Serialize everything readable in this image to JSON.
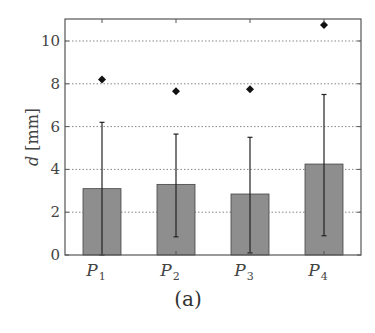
{
  "chart_data": {
    "type": "bar",
    "title": "",
    "caption": "(a)",
    "xlabel": "",
    "ylabel": "d [mm]",
    "ylabel_var": "d",
    "ylabel_unit": "[mm]",
    "ylim": [
      0,
      11
    ],
    "yticks": [
      0,
      2,
      4,
      6,
      8,
      10
    ],
    "grid": "horizontal dotted",
    "categories": [
      "P1",
      "P2",
      "P3",
      "P4"
    ],
    "category_labels": [
      {
        "base": "P",
        "sub": "1"
      },
      {
        "base": "P",
        "sub": "2"
      },
      {
        "base": "P",
        "sub": "3"
      },
      {
        "base": "P",
        "sub": "4"
      }
    ],
    "series": [
      {
        "name": "mean",
        "values": [
          3.1,
          3.3,
          2.85,
          4.25
        ]
      },
      {
        "name": "error_lower",
        "values": [
          0.0,
          0.85,
          0.1,
          0.9
        ]
      },
      {
        "name": "error_upper",
        "values": [
          6.2,
          5.65,
          5.5,
          7.5
        ]
      },
      {
        "name": "max (diamond markers)",
        "values": [
          8.2,
          7.65,
          7.75,
          10.75
        ]
      }
    ],
    "colors": {
      "bar_fill": "#8e8e8e",
      "bar_edge": "#444444",
      "grid": "#888888",
      "axis": "#555555",
      "marker": "#111111"
    }
  }
}
